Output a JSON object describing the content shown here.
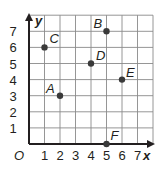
{
  "chart_data": {
    "type": "scatter",
    "title": "",
    "xlabel": "x",
    "ylabel": "y",
    "origin_label": "O",
    "xlim": [
      0,
      8
    ],
    "ylim": [
      0,
      8
    ],
    "grid": true,
    "x_ticks": [
      "1",
      "2",
      "3",
      "4",
      "5",
      "6",
      "7"
    ],
    "y_ticks": [
      "1",
      "2",
      "3",
      "4",
      "5",
      "6",
      "7"
    ],
    "points": [
      {
        "label": "A",
        "x": 2,
        "y": 3
      },
      {
        "label": "B",
        "x": 5,
        "y": 7
      },
      {
        "label": "C",
        "x": 1,
        "y": 6
      },
      {
        "label": "D",
        "x": 4,
        "y": 5
      },
      {
        "label": "E",
        "x": 6,
        "y": 4
      },
      {
        "label": "F",
        "x": 5,
        "y": 0
      }
    ],
    "colors": {
      "grid": "#8a8a8a",
      "axis": "#231f20",
      "point": "#3a3a3a"
    }
  }
}
